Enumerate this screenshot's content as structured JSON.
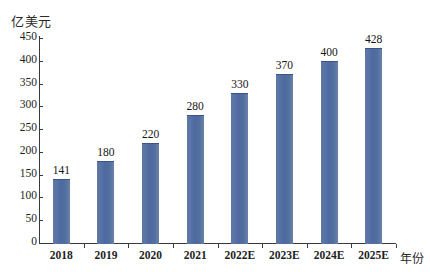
{
  "chart_data": {
    "type": "bar",
    "title": "",
    "subtitle": "",
    "ylabel": "亿美元",
    "xlabel": "年份",
    "categories": [
      "2018",
      "2019",
      "2020",
      "2021",
      "2022E",
      "2023E",
      "2024E",
      "2025E"
    ],
    "values": [
      141,
      180,
      220,
      280,
      330,
      370,
      400,
      428
    ],
    "value_labels": [
      "141",
      "180",
      "220",
      "280",
      "330",
      "370",
      "400",
      "428"
    ],
    "ylim": [
      0,
      450
    ],
    "y_ticks": [
      "0",
      "50",
      "100",
      "150",
      "200",
      "250",
      "300",
      "350",
      "400",
      "450"
    ],
    "y_tick_values": [
      0,
      50,
      100,
      150,
      200,
      250,
      300,
      350,
      400,
      450
    ],
    "grid": false,
    "legend": null,
    "legend_position": "none",
    "series": [
      {
        "name": "",
        "values": [
          141,
          180,
          220,
          280,
          330,
          370,
          400,
          428
        ],
        "color": "#4f6ea8"
      }
    ],
    "colors": {
      "bar": "#4f6ea8",
      "bar_edge": "#3d5585",
      "axis": "#3a3a3a",
      "text": "#1e1e1e",
      "background": "#ffffff"
    }
  }
}
